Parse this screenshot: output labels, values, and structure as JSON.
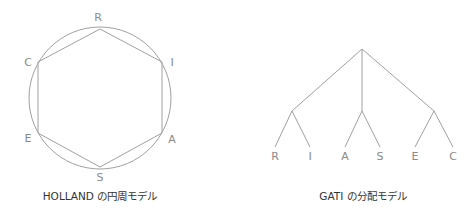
{
  "holland": {
    "title": "HOLLAND の円周モデル",
    "vertices": [
      {
        "label": "R",
        "x": 100,
        "y": 29,
        "lx": 98,
        "ly": 21
      },
      {
        "label": "I",
        "x": 162,
        "y": 62,
        "lx": 172,
        "ly": 66
      },
      {
        "label": "A",
        "x": 162,
        "y": 133,
        "lx": 172,
        "ly": 143
      },
      {
        "label": "S",
        "x": 100,
        "y": 167,
        "lx": 100,
        "ly": 181
      },
      {
        "label": "E",
        "x": 38,
        "y": 133,
        "lx": 28,
        "ly": 142
      },
      {
        "label": "C",
        "x": 38,
        "y": 62,
        "lx": 28,
        "ly": 66
      }
    ],
    "circle": {
      "cx": 100,
      "cy": 98,
      "r": 71
    }
  },
  "gati": {
    "title": "GATI の分配モデル",
    "root": {
      "x": 362,
      "y": 49
    },
    "groups": [
      {
        "x": 292,
        "y": 111,
        "leaves": [
          {
            "label": "R",
            "x": 275
          },
          {
            "label": "I",
            "x": 310
          }
        ]
      },
      {
        "x": 362,
        "y": 111,
        "leaves": [
          {
            "label": "A",
            "x": 345
          },
          {
            "label": "S",
            "x": 380
          }
        ]
      },
      {
        "x": 434,
        "y": 111,
        "leaves": [
          {
            "label": "E",
            "x": 415
          },
          {
            "label": "C",
            "x": 453
          }
        ]
      }
    ],
    "leaf_y": 147,
    "label_y": 160
  },
  "colors": {
    "line": "#a0a0a0",
    "label": "#8a8a8a",
    "caption": "#333333"
  }
}
